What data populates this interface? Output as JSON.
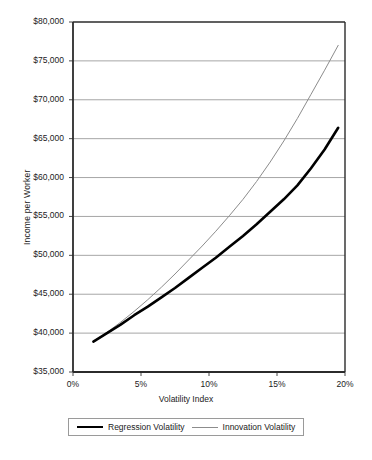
{
  "chart_data": {
    "type": "line",
    "title": "",
    "xlabel": "Volatility Index",
    "ylabel": "Income  per  Worker",
    "xlim": [
      0,
      20
    ],
    "ylim": [
      35000,
      80000
    ],
    "xticks": [
      "0%",
      "5%",
      "10%",
      "15%",
      "20%"
    ],
    "xtick_values": [
      0,
      5,
      10,
      15,
      20
    ],
    "yticks": [
      "$35,000",
      "$40,000",
      "$45,000",
      "$50,000",
      "$55,000",
      "$60,000",
      "$65,000",
      "$70,000",
      "$75,000",
      "$80,000"
    ],
    "ytick_values": [
      35000,
      40000,
      45000,
      50000,
      55000,
      60000,
      65000,
      70000,
      75000,
      80000
    ],
    "grid": "horizontal",
    "legend_position": "bottom",
    "x": [
      1.5,
      2.5,
      3.5,
      4.5,
      5.5,
      6.5,
      7.5,
      8.5,
      9.5,
      10.5,
      11.5,
      12.5,
      13.5,
      14.5,
      15.5,
      16.5,
      17.5,
      18.5,
      19.5
    ],
    "series": [
      {
        "name": "Regression Volatility",
        "color": "#000000",
        "width": 2.6,
        "values": [
          38900,
          40000,
          41100,
          42300,
          43400,
          44600,
          45800,
          47100,
          48400,
          49700,
          51100,
          52500,
          54000,
          55600,
          57200,
          59000,
          61200,
          63600,
          66400
        ]
      },
      {
        "name": "Innovation Volatility",
        "color": "#8c8c8c",
        "width": 1.0,
        "values": [
          38900,
          40100,
          41400,
          42800,
          44300,
          45900,
          47600,
          49400,
          51200,
          53100,
          55100,
          57200,
          59500,
          62000,
          64700,
          67600,
          70700,
          73800,
          77000
        ]
      }
    ]
  },
  "legend": {
    "items": [
      {
        "label": "Regression Volatility"
      },
      {
        "label": "Innovation Volatility"
      }
    ]
  },
  "colors": {
    "regression": "#000000",
    "innovation": "#8c8c8c",
    "grid": "#9c9c9c",
    "axis": "#333333",
    "background": "#ffffff"
  }
}
